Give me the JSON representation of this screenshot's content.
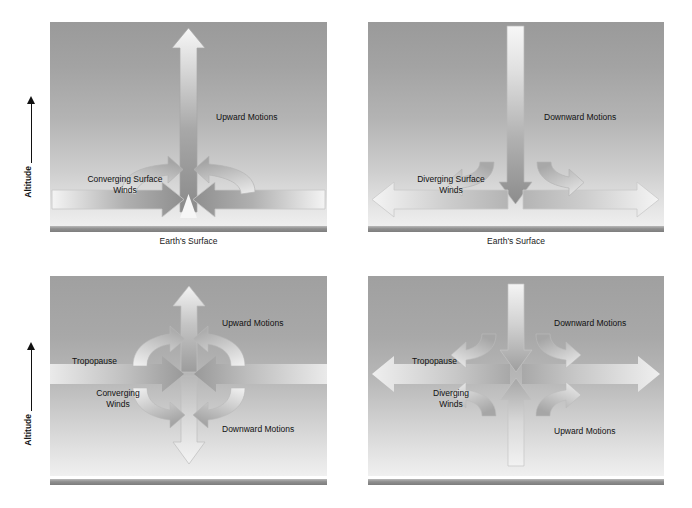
{
  "figure": {
    "type": "schematic-diagram"
  },
  "axes": [
    {
      "label": "Altitude",
      "direction": "up",
      "panel": "top-left"
    },
    {
      "label": "Altitude",
      "direction": "up",
      "panel": "bottom-left"
    }
  ],
  "panels": [
    {
      "id": "top-left",
      "level": "surface",
      "caption": "Earth's Surface",
      "vertical_motion": "upward",
      "labels": {
        "vertical": "Upward Motions",
        "horizontal_line1": "Converging Surface",
        "horizontal_line2": "Winds"
      }
    },
    {
      "id": "top-right",
      "level": "surface",
      "caption": "Earth's Surface",
      "vertical_motion": "downward",
      "labels": {
        "vertical": "Downward Motions",
        "horizontal_line1": "Diverging Surface",
        "horizontal_line2": "Winds"
      }
    },
    {
      "id": "bottom-left",
      "level": "tropopause",
      "caption": "",
      "vertical_motion": "upward-above-downward-below",
      "labels": {
        "tropopause": "Tropopause",
        "wind_line1": "Converging",
        "wind_line2": "Winds",
        "upper": "Upward Motions",
        "lower": "Downward Motions"
      }
    },
    {
      "id": "bottom-right",
      "level": "tropopause",
      "caption": "",
      "vertical_motion": "downward-above-upward-below",
      "labels": {
        "tropopause": "Tropopause",
        "wind_line1": "Diverging",
        "wind_line2": "Winds",
        "upper": "Downward Motions",
        "lower": "Upward Motions"
      }
    }
  ],
  "colors": {
    "sky_top": "#9a9a9a",
    "sky_bottom": "#efefef",
    "ground": "#8f8f8f",
    "arrow_dark": "#8d8d8d",
    "arrow_light": "#f2f2f2",
    "arrow_outline": "#9e9e9e",
    "text": "#1a1a1a"
  }
}
